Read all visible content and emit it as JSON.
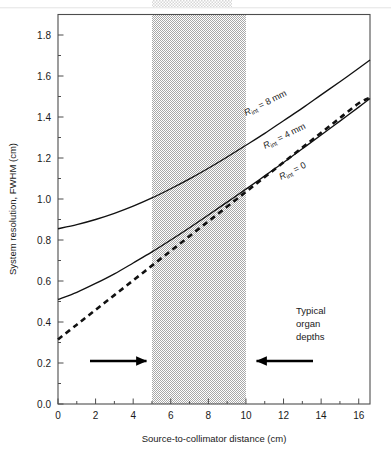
{
  "chart_data": {
    "type": "line",
    "title": "",
    "xlabel": "Source-to-collimator distance (cm)",
    "ylabel": "System resolution, FWHM (cm)",
    "xlim": [
      0,
      16.6
    ],
    "ylim": [
      0.0,
      1.9
    ],
    "grid": false,
    "legend_position": "inline-curve-labels",
    "xticks": [
      0,
      2,
      4,
      6,
      8,
      10,
      12,
      14,
      16
    ],
    "xtick_labels": [
      "0",
      "2",
      "4",
      "6",
      "8",
      "10",
      "12",
      "14",
      "16"
    ],
    "xminor_ticks": [
      1,
      3,
      5,
      7,
      9,
      11,
      13,
      15
    ],
    "yticks": [
      0.0,
      0.2,
      0.4,
      0.6,
      0.8,
      1.0,
      1.2,
      1.4,
      1.6,
      1.8
    ],
    "ytick_labels": [
      "0.0",
      "0.2",
      "0.4",
      "0.6",
      "0.8",
      "1.0",
      "1.2",
      "1.4",
      "1.6",
      "1.8"
    ],
    "yminor_ticks": [
      0.1,
      0.3,
      0.5,
      0.7,
      0.9,
      1.1,
      1.3,
      1.5,
      1.7
    ],
    "x": [
      0,
      1,
      2,
      3,
      4,
      5,
      6,
      7,
      8,
      9,
      10,
      11,
      12,
      13,
      14,
      15,
      16,
      16.6
    ],
    "series": [
      {
        "name": "R_int = 8 mm",
        "label": "Rₘ = 8 mm",
        "label_main": "R",
        "label_sub": "int",
        "label_rest": " = 8 mm",
        "style": "solid",
        "color": "#111111",
        "values": [
          0.855,
          0.875,
          0.9,
          0.93,
          0.965,
          1.005,
          1.05,
          1.098,
          1.15,
          1.205,
          1.262,
          1.32,
          1.382,
          1.443,
          1.508,
          1.572,
          1.638,
          1.678
        ]
      },
      {
        "name": "R_int = 4 mm",
        "label": "Rₘ = 4 mm",
        "label_main": "R",
        "label_sub": "int",
        "label_rest": " = 4 mm",
        "style": "solid",
        "color": "#111111",
        "values": [
          0.51,
          0.545,
          0.588,
          0.635,
          0.688,
          0.742,
          0.8,
          0.86,
          0.922,
          0.985,
          1.048,
          1.113,
          1.178,
          1.245,
          1.312,
          1.38,
          1.448,
          1.49
        ]
      },
      {
        "name": "R_int = 0",
        "label": "Rₘ = 0",
        "label_main": "R",
        "label_sub": "int",
        "label_rest": " = 0",
        "style": "dashed",
        "color": "#111111",
        "values": [
          0.315,
          0.387,
          0.459,
          0.531,
          0.603,
          0.675,
          0.747,
          0.819,
          0.891,
          0.963,
          1.035,
          1.107,
          1.179,
          1.251,
          1.323,
          1.395,
          1.467,
          1.494
        ]
      }
    ],
    "shaded_band": {
      "label": "Typical organ depths",
      "x_start": 5,
      "x_end": 10,
      "fill_pattern": "50% gray stipple",
      "color": "#b3b3b3"
    },
    "annotations": [
      {
        "name": "typical-organ-depths",
        "text_lines": [
          "Typical",
          "organ",
          "depths"
        ]
      },
      {
        "name": "left-arrow",
        "direction": "right",
        "points_to": 5
      },
      {
        "name": "right-arrow",
        "direction": "left",
        "points_to": 10
      }
    ]
  },
  "labels": {
    "y_axis": "System resolution, FWHM (cm)",
    "x_axis": "Source-to-collimator distance (cm)",
    "annot_line1": "Typical",
    "annot_line2": "organ",
    "annot_line3": "depths",
    "c8_r": "R",
    "c8_sub": "int",
    "c8_rest": " = 8 mm",
    "c4_r": "R",
    "c4_sub": "int",
    "c4_rest": " = 4 mm",
    "c0_r": "R",
    "c0_sub": "int",
    "c0_rest": " = 0"
  }
}
